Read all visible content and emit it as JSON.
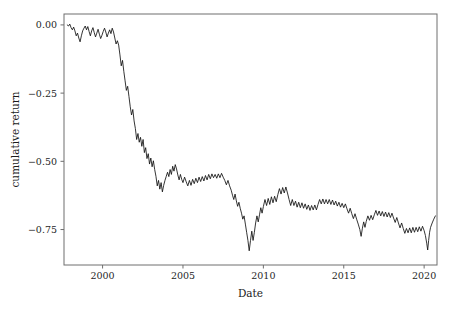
{
  "chart_data": {
    "type": "line",
    "title": "",
    "xlabel": "Date",
    "ylabel": "cumulative return",
    "xlim": [
      1997.6,
      2020.8
    ],
    "ylim": [
      -0.88,
      0.04
    ],
    "xticks": [
      2000,
      2005,
      2010,
      2015,
      2020
    ],
    "xticklabels": [
      "2000",
      "2005",
      "2010",
      "2015",
      "2020"
    ],
    "yticks": [
      0.0,
      -0.25,
      -0.5,
      -0.75
    ],
    "yticklabels": [
      "0.00",
      "−0.25",
      "−0.50",
      "−0.75"
    ],
    "grid": false,
    "legend": null,
    "series": [
      {
        "name": "cumulative return",
        "color": "#111111",
        "x": [
          1997.8,
          1997.88,
          1997.96,
          1998.04,
          1998.12,
          1998.2,
          1998.28,
          1998.36,
          1998.44,
          1998.52,
          1998.6,
          1998.68,
          1998.76,
          1998.84,
          1998.92,
          1999.0,
          1999.08,
          1999.16,
          1999.24,
          1999.32,
          1999.4,
          1999.48,
          1999.56,
          1999.64,
          1999.72,
          1999.8,
          1999.88,
          1999.96,
          2000.04,
          2000.12,
          2000.2,
          2000.28,
          2000.36,
          2000.44,
          2000.52,
          2000.6,
          2000.68,
          2000.76,
          2000.84,
          2000.92,
          2001.0,
          2001.08,
          2001.16,
          2001.24,
          2001.32,
          2001.4,
          2001.48,
          2001.56,
          2001.64,
          2001.72,
          2001.8,
          2001.88,
          2001.96,
          2002.04,
          2002.12,
          2002.2,
          2002.28,
          2002.36,
          2002.44,
          2002.52,
          2002.6,
          2002.68,
          2002.76,
          2002.84,
          2002.92,
          2003.0,
          2003.08,
          2003.16,
          2003.24,
          2003.32,
          2003.4,
          2003.48,
          2003.56,
          2003.64,
          2003.72,
          2003.8,
          2003.88,
          2003.96,
          2004.04,
          2004.12,
          2004.2,
          2004.28,
          2004.36,
          2004.44,
          2004.52,
          2004.6,
          2004.68,
          2004.76,
          2004.84,
          2004.92,
          2005.0,
          2005.1,
          2005.2,
          2005.3,
          2005.4,
          2005.5,
          2005.6,
          2005.7,
          2005.8,
          2005.9,
          2006.0,
          2006.1,
          2006.2,
          2006.3,
          2006.4,
          2006.5,
          2006.6,
          2006.7,
          2006.8,
          2006.9,
          2007.0,
          2007.1,
          2007.2,
          2007.3,
          2007.4,
          2007.5,
          2007.6,
          2007.7,
          2007.8,
          2007.9,
          2008.0,
          2008.08,
          2008.16,
          2008.24,
          2008.32,
          2008.4,
          2008.48,
          2008.56,
          2008.64,
          2008.72,
          2008.8,
          2008.88,
          2008.96,
          2009.04,
          2009.12,
          2009.2,
          2009.28,
          2009.36,
          2009.44,
          2009.52,
          2009.6,
          2009.68,
          2009.76,
          2009.84,
          2009.92,
          2010.0,
          2010.1,
          2010.2,
          2010.3,
          2010.4,
          2010.5,
          2010.6,
          2010.7,
          2010.8,
          2010.9,
          2011.0,
          2011.1,
          2011.2,
          2011.3,
          2011.4,
          2011.5,
          2011.6,
          2011.7,
          2011.8,
          2011.9,
          2012.0,
          2012.1,
          2012.2,
          2012.3,
          2012.4,
          2012.5,
          2012.6,
          2012.7,
          2012.8,
          2012.9,
          2013.0,
          2013.1,
          2013.2,
          2013.3,
          2013.4,
          2013.5,
          2013.6,
          2013.7,
          2013.8,
          2013.9,
          2014.0,
          2014.1,
          2014.2,
          2014.3,
          2014.4,
          2014.5,
          2014.6,
          2014.7,
          2014.8,
          2014.9,
          2015.0,
          2015.1,
          2015.2,
          2015.3,
          2015.4,
          2015.5,
          2015.6,
          2015.7,
          2015.8,
          2015.9,
          2016.0,
          2016.08,
          2016.16,
          2016.24,
          2016.32,
          2016.4,
          2016.5,
          2016.6,
          2016.7,
          2016.8,
          2016.9,
          2017.0,
          2017.1,
          2017.2,
          2017.3,
          2017.4,
          2017.5,
          2017.6,
          2017.7,
          2017.8,
          2017.9,
          2018.0,
          2018.1,
          2018.2,
          2018.3,
          2018.4,
          2018.5,
          2018.6,
          2018.7,
          2018.8,
          2018.9,
          2019.0,
          2019.1,
          2019.2,
          2019.3,
          2019.4,
          2019.5,
          2019.6,
          2019.7,
          2019.8,
          2019.9,
          2020.0,
          2020.08,
          2020.16,
          2020.22,
          2020.28,
          2020.34,
          2020.4,
          2020.5,
          2020.6,
          2020.7
        ],
        "y": [
          0.0,
          -0.004,
          0.003,
          -0.01,
          -0.018,
          -0.008,
          -0.022,
          -0.04,
          -0.03,
          -0.048,
          -0.062,
          -0.04,
          -0.022,
          -0.012,
          -0.004,
          -0.018,
          -0.006,
          -0.024,
          -0.04,
          -0.022,
          -0.01,
          -0.028,
          -0.044,
          -0.03,
          -0.016,
          -0.034,
          -0.05,
          -0.038,
          -0.024,
          -0.012,
          -0.026,
          -0.044,
          -0.03,
          -0.018,
          -0.032,
          -0.012,
          -0.026,
          -0.048,
          -0.07,
          -0.058,
          -0.074,
          -0.11,
          -0.15,
          -0.13,
          -0.17,
          -0.205,
          -0.24,
          -0.225,
          -0.262,
          -0.3,
          -0.33,
          -0.31,
          -0.352,
          -0.38,
          -0.42,
          -0.398,
          -0.43,
          -0.412,
          -0.445,
          -0.42,
          -0.468,
          -0.45,
          -0.49,
          -0.472,
          -0.51,
          -0.488,
          -0.52,
          -0.498,
          -0.53,
          -0.555,
          -0.59,
          -0.57,
          -0.602,
          -0.578,
          -0.612,
          -0.588,
          -0.57,
          -0.555,
          -0.54,
          -0.556,
          -0.53,
          -0.548,
          -0.518,
          -0.536,
          -0.512,
          -0.528,
          -0.55,
          -0.568,
          -0.548,
          -0.566,
          -0.578,
          -0.558,
          -0.575,
          -0.59,
          -0.57,
          -0.588,
          -0.566,
          -0.582,
          -0.562,
          -0.578,
          -0.558,
          -0.574,
          -0.556,
          -0.572,
          -0.552,
          -0.568,
          -0.548,
          -0.564,
          -0.546,
          -0.56,
          -0.548,
          -0.562,
          -0.546,
          -0.56,
          -0.544,
          -0.558,
          -0.57,
          -0.586,
          -0.57,
          -0.59,
          -0.606,
          -0.624,
          -0.64,
          -0.62,
          -0.645,
          -0.665,
          -0.65,
          -0.672,
          -0.69,
          -0.712,
          -0.7,
          -0.73,
          -0.76,
          -0.79,
          -0.828,
          -0.79,
          -0.756,
          -0.79,
          -0.76,
          -0.726,
          -0.7,
          -0.722,
          -0.696,
          -0.67,
          -0.69,
          -0.666,
          -0.64,
          -0.662,
          -0.636,
          -0.658,
          -0.63,
          -0.652,
          -0.628,
          -0.648,
          -0.622,
          -0.6,
          -0.62,
          -0.596,
          -0.616,
          -0.594,
          -0.616,
          -0.64,
          -0.662,
          -0.64,
          -0.662,
          -0.646,
          -0.668,
          -0.65,
          -0.67,
          -0.652,
          -0.672,
          -0.656,
          -0.676,
          -0.66,
          -0.68,
          -0.662,
          -0.678,
          -0.66,
          -0.678,
          -0.658,
          -0.64,
          -0.656,
          -0.638,
          -0.656,
          -0.64,
          -0.656,
          -0.64,
          -0.658,
          -0.642,
          -0.66,
          -0.646,
          -0.664,
          -0.65,
          -0.668,
          -0.654,
          -0.67,
          -0.656,
          -0.674,
          -0.69,
          -0.672,
          -0.692,
          -0.71,
          -0.692,
          -0.712,
          -0.73,
          -0.75,
          -0.775,
          -0.745,
          -0.722,
          -0.742,
          -0.72,
          -0.7,
          -0.716,
          -0.698,
          -0.714,
          -0.696,
          -0.68,
          -0.698,
          -0.682,
          -0.7,
          -0.684,
          -0.702,
          -0.686,
          -0.704,
          -0.688,
          -0.706,
          -0.69,
          -0.708,
          -0.724,
          -0.706,
          -0.726,
          -0.744,
          -0.726,
          -0.746,
          -0.764,
          -0.746,
          -0.762,
          -0.744,
          -0.762,
          -0.742,
          -0.76,
          -0.742,
          -0.758,
          -0.74,
          -0.756,
          -0.738,
          -0.754,
          -0.772,
          -0.8,
          -0.825,
          -0.79,
          -0.76,
          -0.742,
          -0.726,
          -0.712,
          -0.7
        ]
      }
    ]
  },
  "figure": {
    "background_color": "#ffffff",
    "line_color": "#111111",
    "spine_color": "#6e6e6e"
  }
}
